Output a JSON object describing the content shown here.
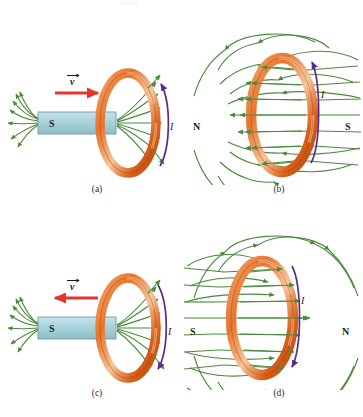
{
  "figure": {
    "title": "",
    "background_color": "#ffffff",
    "colors": {
      "coil_orange": "#e8742c",
      "coil_orange_light": "#f6b077",
      "coil_orange_dark": "#bf4f14",
      "field_green": "#4a8a3c",
      "magnet_fill": "#a9d3dc",
      "magnet_stroke": "#6f9aa4",
      "velocity_red": "#e8342a",
      "current_purple": "#5a2d8c",
      "text_black": "#1c1c1c"
    }
  },
  "panels": [
    {
      "id": "a",
      "caption": "(a)",
      "kind": "magnet-approaching-loop",
      "magnet": {
        "left_pole": "S",
        "right_pole": "N"
      },
      "velocity": {
        "label": "v",
        "vector_symbol": "→",
        "direction": "right",
        "color": "#e8342a"
      },
      "current": {
        "label": "I",
        "arrow_direction": "up",
        "color": "#5a2d8c"
      },
      "field_color": "#4a8a3c"
    },
    {
      "id": "b",
      "caption": "(b)",
      "kind": "loop-field-lines",
      "poles": {
        "left": "N",
        "right": "S"
      },
      "field_direction": "left",
      "current": {
        "label": "I",
        "arrow_direction": "up",
        "color": "#5a2d8c"
      },
      "field_color": "#4a8a3c"
    },
    {
      "id": "c",
      "caption": "(c)",
      "kind": "magnet-receding-loop",
      "magnet": {
        "left_pole": "S",
        "right_pole": "N"
      },
      "velocity": {
        "label": "v",
        "vector_symbol": "→",
        "direction": "left",
        "color": "#e8342a"
      },
      "current": {
        "label": "I",
        "arrow_direction": "down",
        "color": "#5a2d8c"
      },
      "field_color": "#4a8a3c"
    },
    {
      "id": "d",
      "caption": "(d)",
      "kind": "loop-field-lines",
      "poles": {
        "left": "S",
        "right": "N"
      },
      "field_direction": "right",
      "current": {
        "label": "I",
        "arrow_direction": "down",
        "color": "#5a2d8c"
      },
      "field_color": "#4a8a3c"
    }
  ]
}
